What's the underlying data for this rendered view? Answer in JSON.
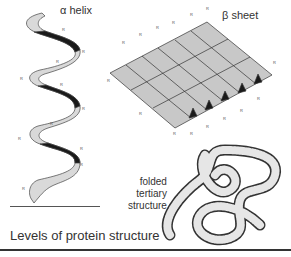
{
  "diagram": {
    "title": "Levels of protein structure",
    "labels": {
      "alpha_helix": "α helix",
      "beta_sheet": "β sheet",
      "tertiary": [
        "folded",
        "tertiary",
        "structure"
      ]
    },
    "side_chain_label": "R",
    "colors": {
      "ribbon_light": "#d9d9d9",
      "ribbon_dark": "#1a1a1a",
      "sheet_face": "#c8c8c8",
      "outline": "#333333",
      "text": "#333333"
    }
  }
}
